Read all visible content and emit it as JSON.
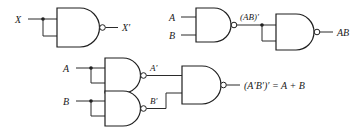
{
  "figure": {
    "type": "logic-gate-diagram",
    "background_color": "#ffffff",
    "line_color": "#2b2b2b",
    "label_color": "#1a1a1a",
    "gate_type": "NAND"
  },
  "circuits": [
    {
      "id": "nand-inverter",
      "description": "NAND gate with both inputs tied together acting as an inverter",
      "inputs": [
        {
          "label": "X"
        }
      ],
      "outputs": [
        {
          "label": "X′"
        }
      ],
      "intermediate_labels": []
    },
    {
      "id": "nand-and",
      "description": "NAND gate followed by NAND inverter produces AND",
      "inputs": [
        {
          "label": "A"
        },
        {
          "label": "B"
        }
      ],
      "outputs": [
        {
          "label": "AB"
        }
      ],
      "intermediate_labels": [
        {
          "label": "(AB)′"
        }
      ]
    },
    {
      "id": "nand-or",
      "description": "Two NAND inverters feeding a NAND gate produces OR",
      "inputs": [
        {
          "label": "A"
        },
        {
          "label": "B"
        }
      ],
      "outputs": [
        {
          "label": "(A′B′)′ = A + B"
        }
      ],
      "intermediate_labels": [
        {
          "label": "A′"
        },
        {
          "label": "B′"
        }
      ]
    }
  ]
}
